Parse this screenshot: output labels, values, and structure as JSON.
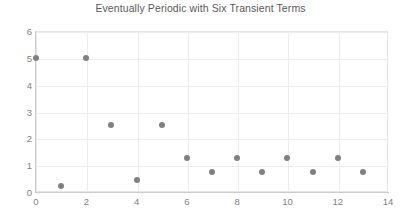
{
  "chart_data": {
    "type": "scatter",
    "title": "Eventually Periodic with Six Transient Terms",
    "xlabel": "",
    "ylabel": "",
    "xlim": [
      0,
      14
    ],
    "ylim": [
      0,
      6
    ],
    "xticks": [
      0,
      2,
      4,
      6,
      8,
      10,
      12,
      14
    ],
    "yticks": [
      0,
      1,
      2,
      3,
      4,
      5,
      6
    ],
    "grid": true,
    "legend": null,
    "marker_color": "#808080",
    "grid_color": "#ededed",
    "axis_color": "#cccccc",
    "tick_label_color": "#7f7f7f",
    "title_color": "#595959",
    "x": [
      0,
      1,
      2,
      3,
      4,
      5,
      6,
      7,
      8,
      9,
      10,
      11,
      12,
      13
    ],
    "y": [
      5,
      0.22,
      5,
      2.5,
      0.45,
      2.5,
      1.27,
      0.75,
      1.27,
      0.75,
      1.27,
      0.75,
      1.27,
      0.75
    ],
    "points": [
      {
        "x": 0,
        "y": 5
      },
      {
        "x": 1,
        "y": 0.22
      },
      {
        "x": 2,
        "y": 5
      },
      {
        "x": 3,
        "y": 2.5
      },
      {
        "x": 4,
        "y": 0.45
      },
      {
        "x": 5,
        "y": 2.5
      },
      {
        "x": 6,
        "y": 1.27
      },
      {
        "x": 7,
        "y": 0.75
      },
      {
        "x": 8,
        "y": 1.27
      },
      {
        "x": 9,
        "y": 0.75
      },
      {
        "x": 10,
        "y": 1.27
      },
      {
        "x": 11,
        "y": 0.75
      },
      {
        "x": 12,
        "y": 1.27
      },
      {
        "x": 13,
        "y": 0.75
      }
    ]
  }
}
